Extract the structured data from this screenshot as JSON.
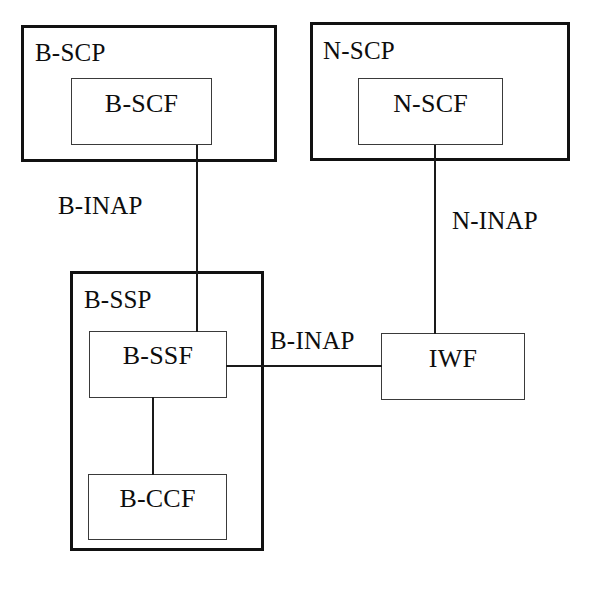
{
  "diagram": {
    "background_color": "#ffffff",
    "line_color": "#1a1a1a",
    "text_color": "#0d0d0d"
  },
  "nodes": {
    "b_scp": {
      "label": "B-SCP",
      "type": "outer-system"
    },
    "b_scf": {
      "label": "B-SCF",
      "type": "inner-function"
    },
    "n_scp": {
      "label": "N-SCP",
      "type": "outer-system"
    },
    "n_scf": {
      "label": "N-SCF",
      "type": "inner-function"
    },
    "b_ssp": {
      "label": "B-SSP",
      "type": "outer-system"
    },
    "b_ssf": {
      "label": "B-SSF",
      "type": "inner-function"
    },
    "b_ccf": {
      "label": "B-CCF",
      "type": "inner-function"
    },
    "iwf": {
      "label": "IWF",
      "type": "standalone-function"
    }
  },
  "connections": {
    "b_scf_to_b_ssf": {
      "label": "B-INAP"
    },
    "n_scf_to_iwf": {
      "label": "N-INAP"
    },
    "b_ssf_to_iwf": {
      "label": "B-INAP"
    },
    "b_ssf_to_b_ccf": {
      "label": ""
    }
  }
}
